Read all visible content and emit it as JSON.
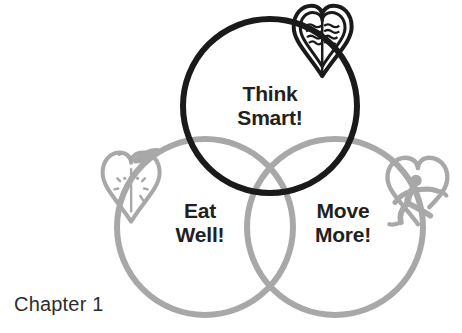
{
  "figure": {
    "name": "three-circle-venn-diagram",
    "caption": "Chapter 1",
    "background_color": "#ffffff",
    "circles": [
      {
        "id": "think-smart",
        "label": "Think\nSmart!",
        "stroke_color": "#1a1a1a",
        "stroke_width": 6,
        "cx": 270,
        "cy": 106,
        "r": 87,
        "icon": "brain-heart-icon"
      },
      {
        "id": "eat-well",
        "label": "Eat\nWell!",
        "stroke_color": "#a8a8a8",
        "stroke_width": 6,
        "cx": 205,
        "cy": 227,
        "r": 88,
        "icon": "apple-heart-icon"
      },
      {
        "id": "move-more",
        "label": "Move\nMore!",
        "stroke_color": "#a8a8a8",
        "stroke_width": 6,
        "cx": 335,
        "cy": 227,
        "r": 88,
        "icon": "runner-heart-icon"
      }
    ],
    "labels": {
      "think_smart": "Think\nSmart!",
      "eat_well": "Eat\nWell!",
      "move_more": "Move\nMore!"
    },
    "icons": {
      "brain_heart": "brain-heart-icon",
      "apple_heart": "apple-heart-icon",
      "runner_heart": "runner-heart-icon"
    },
    "colors": {
      "black": "#1a1a1a",
      "gray": "#a8a8a8",
      "text": "#231f20",
      "caption": "#2c2c2c"
    }
  }
}
